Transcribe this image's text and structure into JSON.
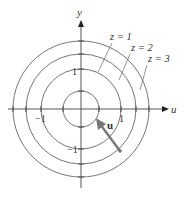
{
  "diagram": {
    "axes": {
      "x_label": "u",
      "y_label": "y"
    },
    "tick_labels": {
      "pos_x": "1",
      "neg_x": "−1",
      "pos_y": "1",
      "neg_y": "−1"
    },
    "level_curves": [
      {
        "label": "z = 1"
      },
      {
        "label": "z = 2"
      },
      {
        "label": "z = 3"
      }
    ],
    "vector": {
      "label": "u"
    },
    "colors": {
      "line": "#555555",
      "vector": "#777777",
      "axis": "#333333"
    }
  }
}
